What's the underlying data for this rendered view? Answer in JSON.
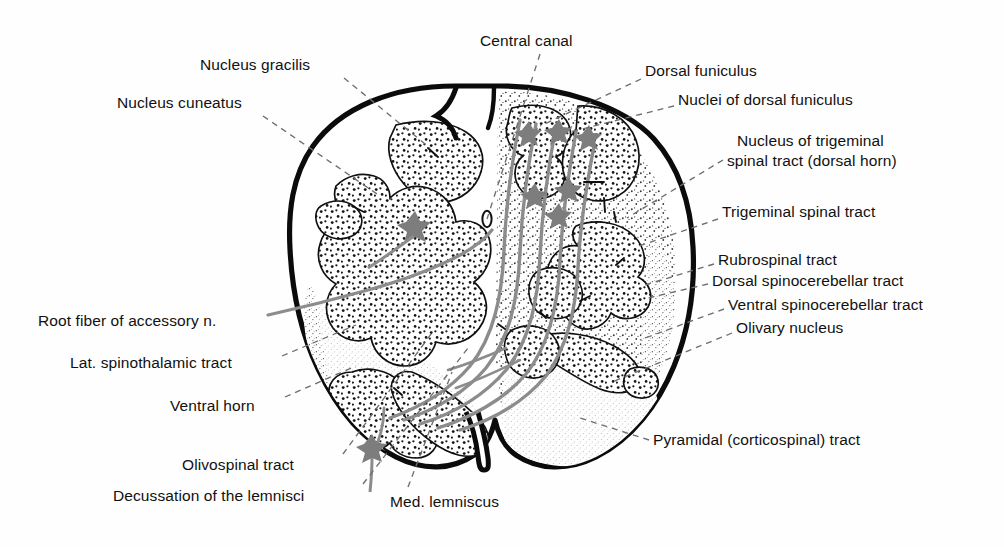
{
  "figure": {
    "width": 1004,
    "height": 547,
    "background_color": "#ffffff",
    "ink_color": "#111111",
    "fiber_color": "#8b8b8b",
    "stipple_color": "#1a1a1a",
    "leader_line_color": "#6e6e6e"
  },
  "labels": [
    {
      "id": "nucleus-gracilis",
      "text": "Nucleus gracilis",
      "side": "left",
      "x": 200,
      "y": 57,
      "anchor": {
        "x": 344,
        "y": 78
      },
      "target": {
        "x": 430,
        "y": 148
      },
      "leader": "dashed"
    },
    {
      "id": "nucleus-cuneatus",
      "text": "Nucleus cuneatus",
      "side": "left",
      "x": 117,
      "y": 95,
      "anchor": {
        "x": 263,
        "y": 116
      },
      "target": {
        "x": 380,
        "y": 196
      },
      "leader": "dashed"
    },
    {
      "id": "central-canal",
      "text": "Central canal",
      "side": "top",
      "x": 480,
      "y": 33,
      "anchor": {
        "x": 540,
        "y": 54
      },
      "target": {
        "x": 487,
        "y": 219
      },
      "leader": "dashed"
    },
    {
      "id": "dorsal-funiculus",
      "text": "Dorsal funiculus",
      "side": "right",
      "x": 645,
      "y": 63,
      "anchor": {
        "x": 641,
        "y": 79
      },
      "target": {
        "x": 540,
        "y": 126
      },
      "leader": "dashed"
    },
    {
      "id": "nuclei-of-dorsal-funiculus",
      "text": "Nuclei of dorsal funiculus",
      "side": "right",
      "x": 678,
      "y": 92,
      "anchor": {
        "x": 674,
        "y": 106
      },
      "target": {
        "x": 566,
        "y": 133
      },
      "leader": "dashed"
    },
    {
      "id": "nucleus-of-trigeminal-spinal-tract-line1",
      "text": "Nucleus of trigeminal",
      "side": "right",
      "x": 737,
      "y": 133,
      "anchor": null,
      "target": null,
      "leader": "none"
    },
    {
      "id": "nucleus-of-trigeminal-spinal-tract-line2",
      "text": "spinal tract (dorsal horn)",
      "side": "right",
      "x": 727,
      "y": 153,
      "anchor": {
        "x": 723,
        "y": 160
      },
      "target": {
        "x": 627,
        "y": 218
      },
      "leader": "dashed"
    },
    {
      "id": "trigeminal-spinal-tract",
      "text": "Trigeminal spinal tract",
      "side": "right",
      "x": 722,
      "y": 204,
      "anchor": {
        "x": 718,
        "y": 219
      },
      "target": {
        "x": 636,
        "y": 247
      },
      "leader": "dashed"
    },
    {
      "id": "rubrospinal-tract",
      "text": "Rubrospinal tract",
      "side": "right",
      "x": 718,
      "y": 252,
      "anchor": {
        "x": 714,
        "y": 264
      },
      "target": {
        "x": 645,
        "y": 285
      },
      "leader": "dashed"
    },
    {
      "id": "dorsal-spinocerebellar-tract",
      "text": "Dorsal spinocerebellar tract",
      "side": "right",
      "x": 712,
      "y": 273,
      "anchor": {
        "x": 708,
        "y": 284
      },
      "target": {
        "x": 648,
        "y": 298
      },
      "leader": "dashed"
    },
    {
      "id": "ventral-spinocerebellar-tract",
      "text": "Ventral spinocerebellar tract",
      "side": "right",
      "x": 728,
      "y": 297,
      "anchor": {
        "x": 724,
        "y": 309
      },
      "target": {
        "x": 640,
        "y": 340
      },
      "leader": "dashed"
    },
    {
      "id": "olivary-nucleus",
      "text": "Olivary nucleus",
      "side": "right",
      "x": 736,
      "y": 320,
      "anchor": {
        "x": 732,
        "y": 333
      },
      "target": {
        "x": 612,
        "y": 382
      },
      "leader": "dashed"
    },
    {
      "id": "pyramidal-corticospinal-tract",
      "text": "Pyramidal (corticospinal) tract",
      "side": "right",
      "x": 653,
      "y": 432,
      "anchor": {
        "x": 649,
        "y": 440
      },
      "target": {
        "x": 580,
        "y": 418
      },
      "leader": "dashed"
    },
    {
      "id": "root-fiber-of-accessory-n",
      "text": "Root fiber of accessory n.",
      "side": "left",
      "x": 38,
      "y": 313,
      "anchor": {
        "x": 268,
        "y": 315
      },
      "target": {
        "x": 356,
        "y": 289
      },
      "leader": "solid"
    },
    {
      "id": "lat-spinothalamic-tract",
      "text": "Lat. spinothalamic tract",
      "side": "left",
      "x": 70,
      "y": 355,
      "anchor": {
        "x": 282,
        "y": 356
      },
      "target": {
        "x": 356,
        "y": 325
      },
      "leader": "dashed"
    },
    {
      "id": "ventral-horn",
      "text": "Ventral horn",
      "side": "left",
      "x": 170,
      "y": 398,
      "anchor": {
        "x": 285,
        "y": 397
      },
      "target": {
        "x": 356,
        "y": 366
      },
      "leader": "dashed"
    },
    {
      "id": "olivospinal-tract",
      "text": "Olivospinal tract",
      "side": "left",
      "x": 182,
      "y": 457,
      "anchor": {
        "x": 343,
        "y": 454
      },
      "target": {
        "x": 434,
        "y": 330
      },
      "leader": "dashed"
    },
    {
      "id": "decussation-of-the-lemnisci",
      "text": "Decussation of the lemnisci",
      "side": "left",
      "x": 113,
      "y": 488,
      "anchor": {
        "x": 363,
        "y": 484
      },
      "target": {
        "x": 468,
        "y": 348
      },
      "leader": "dashed"
    },
    {
      "id": "med-lemniscus",
      "text": "Med. lemniscus",
      "side": "bottom",
      "x": 390,
      "y": 494,
      "anchor": {
        "x": 408,
        "y": 487
      },
      "target": {
        "x": 452,
        "y": 372
      },
      "leader": "dashed"
    }
  ],
  "structures": [
    {
      "id": "outer-boundary",
      "name": "Pial outline of medulla",
      "type": "thick-outline"
    },
    {
      "id": "ventral-median-fissure",
      "name": "Ventral median fissure",
      "type": "notch"
    },
    {
      "id": "dorsal-median-sulcus",
      "name": "Dorsal median sulcus",
      "type": "notch"
    },
    {
      "id": "gray-matter-coarse",
      "name": "Coarse-stippled gray matter",
      "type": "stipple-coarse"
    },
    {
      "id": "white-matter-fine",
      "name": "Fine-stippled white matter tract",
      "type": "stipple-fine"
    },
    {
      "id": "internal-arcuate-fibers",
      "name": "Internal arcuate fibers",
      "type": "gray-fiber-bundle"
    },
    {
      "id": "central-canal-lumen",
      "name": "Central canal lumen",
      "type": "small-oval"
    },
    {
      "id": "neuron-somata",
      "name": "Multipolar neuron cell bodies",
      "type": "gray-star"
    }
  ]
}
